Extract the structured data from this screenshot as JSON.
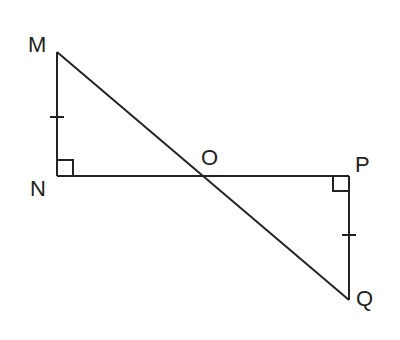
{
  "diagram": {
    "stroke_color": "#222222",
    "background": "#ffffff",
    "points": {
      "M": {
        "label": "M",
        "x": 57,
        "y": 52
      },
      "N": {
        "label": "N",
        "x": 57,
        "y": 176
      },
      "O": {
        "label": "O",
        "x": 205,
        "y": 176
      },
      "P": {
        "label": "P",
        "x": 349,
        "y": 176
      },
      "Q": {
        "label": "Q",
        "x": 349,
        "y": 300
      }
    },
    "segments": [
      "MN",
      "NP",
      "PQ",
      "MQ"
    ],
    "right_angles": [
      "N",
      "P"
    ],
    "congruence_ticks": [
      "MN",
      "PQ"
    ]
  }
}
